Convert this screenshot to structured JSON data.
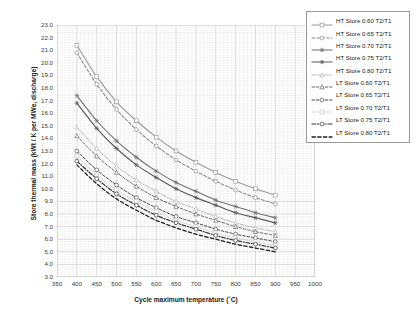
{
  "chart_data": {
    "type": "line",
    "title": "",
    "xlabel": "Cycle maximum temperature (˚C)",
    "ylabel": "Store thermal mass (kWt / K per MWe, discharge)",
    "xlim": [
      350,
      1000
    ],
    "ylim": [
      3.0,
      23.0
    ],
    "xticks": [
      350,
      400,
      450,
      500,
      550,
      600,
      650,
      700,
      750,
      800,
      850,
      900,
      950,
      1000
    ],
    "yticks": [
      3.0,
      4.0,
      5.0,
      6.0,
      7.0,
      8.0,
      9.0,
      10.0,
      11.0,
      12.0,
      13.0,
      14.0,
      15.0,
      16.0,
      17.0,
      18.0,
      19.0,
      20.0,
      21.0,
      22.0,
      23.0
    ],
    "xtick_labels": [
      "350",
      "400",
      "450",
      "500",
      "550",
      "600",
      "650",
      "700",
      "750",
      "800",
      "850",
      "900",
      "950",
      "1000"
    ],
    "ytick_labels": [
      "3.0",
      "4.0",
      "5.0",
      "6.0",
      "7.0",
      "8.0",
      "9.0",
      "10.0",
      "11.0",
      "12.0",
      "13.0",
      "14.0",
      "15.0",
      "16.0",
      "17.0",
      "18.0",
      "19.0",
      "20.0",
      "21.0",
      "22.0",
      "23.0"
    ],
    "grid": true,
    "minor_grid": true,
    "minor_per_major_x": 5,
    "minor_per_major_y": 5,
    "legend_position": "top-right",
    "x": [
      400,
      450,
      500,
      550,
      600,
      650,
      700,
      750,
      800,
      850,
      900
    ],
    "series": [
      {
        "name": "HT Store 0.60 T2/T1",
        "label": "HT Store 0.60 T2/T1",
        "color": "#9a9a9a",
        "dash": "none",
        "marker": "square",
        "width": 1.1,
        "values": [
          21.4,
          18.9,
          16.9,
          15.4,
          14.1,
          13.0,
          12.1,
          11.3,
          10.6,
          10.0,
          9.5
        ]
      },
      {
        "name": "HT Store 0.65 T2/T1",
        "label": "HT Store 0.65 T2/T1",
        "color": "#8d8d8d",
        "dash": "dash",
        "marker": "circle",
        "width": 1.1,
        "values": [
          20.8,
          18.3,
          16.3,
          14.7,
          13.4,
          12.3,
          11.4,
          10.6,
          9.9,
          9.3,
          8.8
        ]
      },
      {
        "name": "HT Store 0.70 T2/T1",
        "label": "HT Store 0.70 T2/T1",
        "color": "#707070",
        "dash": "none",
        "marker": "star",
        "width": 1.1,
        "values": [
          17.4,
          15.4,
          13.8,
          12.5,
          11.4,
          10.5,
          9.8,
          9.1,
          8.6,
          8.1,
          7.7
        ]
      },
      {
        "name": "HT Store 0.75 T2/T1",
        "label": "HT Store 0.75 T2/T1",
        "color": "#5a5a5a",
        "dash": "none",
        "marker": "star",
        "width": 1.2,
        "values": [
          16.8,
          14.8,
          13.2,
          11.9,
          10.9,
          10.0,
          9.3,
          8.7,
          8.1,
          7.7,
          7.3
        ]
      },
      {
        "name": "HT Store 0.80 T2/T1",
        "label": "HT Store 0.80 T2/T1",
        "color": "#b5b5b5",
        "dash": "dashdot",
        "marker": "triangle",
        "width": 1.0,
        "values": [
          14.9,
          13.2,
          11.8,
          10.7,
          9.8,
          9.0,
          8.4,
          7.8,
          7.3,
          6.9,
          6.6
        ]
      },
      {
        "name": "LT Store 0.60 T2/T1",
        "label": "LT Store 0.60 T2/T1",
        "color": "#6b6b6b",
        "dash": "dash",
        "marker": "triangle",
        "width": 1.0,
        "values": [
          14.2,
          12.6,
          11.3,
          10.2,
          9.3,
          8.6,
          8.0,
          7.5,
          7.0,
          6.6,
          6.3
        ]
      },
      {
        "name": "LT Store 0.65 T2/T1",
        "label": "LT Store 0.65 T2/T1",
        "color": "#4a4a4a",
        "dash": "dash",
        "marker": "circle",
        "width": 1.0,
        "values": [
          13.0,
          11.5,
          10.3,
          9.3,
          8.5,
          7.8,
          7.3,
          6.8,
          6.4,
          6.1,
          5.8
        ]
      },
      {
        "name": "LT Store 0.70 T2/T1",
        "label": "LT Store 0.70 T2/T1",
        "color": "#c9c9c9",
        "dash": "dot",
        "marker": "square",
        "width": 1.0,
        "values": [
          12.6,
          11.1,
          9.9,
          9.0,
          8.2,
          7.5,
          7.0,
          6.5,
          6.1,
          5.8,
          5.5
        ]
      },
      {
        "name": "LT Store 0.75 T2/T1",
        "label": "LT Store 0.75 T2/T1",
        "color": "#333333",
        "dash": "dashdot",
        "marker": "circle",
        "width": 1.2,
        "values": [
          12.2,
          10.8,
          9.6,
          8.7,
          7.9,
          7.3,
          6.8,
          6.3,
          5.9,
          5.6,
          5.3
        ]
      },
      {
        "name": "LT Store 0.80 T2/T1",
        "label": "LT Store 0.80 T2/T1",
        "color": "#1f1f1f",
        "dash": "dash",
        "marker": "none",
        "width": 1.3,
        "values": [
          11.9,
          10.4,
          9.2,
          8.3,
          7.5,
          6.9,
          6.4,
          6.0,
          5.6,
          5.3,
          5.0
        ]
      }
    ]
  }
}
